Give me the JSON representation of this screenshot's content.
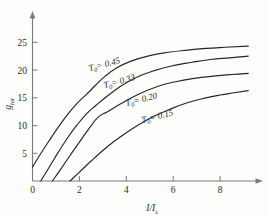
{
  "chart_data": {
    "type": "line",
    "title": "",
    "xlabel": "I/I_s",
    "ylabel": "g_tot",
    "xlim": [
      0,
      9.6
    ],
    "ylim": [
      0,
      26.5
    ],
    "grid": false,
    "legend_position": "inline-curve-labels",
    "xticks": [
      0,
      2,
      4,
      6,
      8
    ],
    "xtick_labels": [
      "0",
      "2",
      "4",
      "6",
      "8"
    ],
    "yticks": [
      5,
      10,
      15,
      20,
      25
    ],
    "ytick_labels": [
      "5",
      "10",
      "15",
      "20",
      "25"
    ],
    "series": [
      {
        "name": "T0 = 0.45",
        "label": "T",
        "label_sub": "0",
        "label_value": "= 0.45",
        "x": [
          0.0,
          0.3,
          0.7,
          1.1,
          1.5,
          1.9,
          2.3,
          2.7,
          3.1,
          3.6,
          4.2,
          5.0,
          5.8,
          6.6,
          7.4,
          8.2,
          9.2
        ],
        "y": [
          2.5,
          4.6,
          7.2,
          9.7,
          12.0,
          14.0,
          15.6,
          17.3,
          18.9,
          20.4,
          21.6,
          22.6,
          23.2,
          23.6,
          23.9,
          24.1,
          24.3
        ]
      },
      {
        "name": "T0 = 0.33",
        "label": "T",
        "label_sub": "0",
        "label_value": "= 0.33",
        "x": [
          0.35,
          0.7,
          1.1,
          1.5,
          1.9,
          2.3,
          2.7,
          3.1,
          3.7,
          4.4,
          5.2,
          6.0,
          6.8,
          7.6,
          8.4,
          9.2
        ],
        "y": [
          0.0,
          2.4,
          5.2,
          7.8,
          10.1,
          12.1,
          13.6,
          15.0,
          16.9,
          18.6,
          19.9,
          20.8,
          21.4,
          21.9,
          22.2,
          22.5
        ]
      },
      {
        "name": "T0 = 0.20",
        "label": "T",
        "label_sub": "0",
        "label_value": "= 0.20",
        "x": [
          0.85,
          1.2,
          1.6,
          2.0,
          2.4,
          2.8,
          3.2,
          3.8,
          4.5,
          5.3,
          6.1,
          6.9,
          7.7,
          8.5,
          9.2
        ],
        "y": [
          0.0,
          2.1,
          4.6,
          7.0,
          9.4,
          11.5,
          12.5,
          14.0,
          15.6,
          17.0,
          17.9,
          18.5,
          18.9,
          19.2,
          19.4
        ]
      },
      {
        "name": "T0 = 0.15",
        "label": "T",
        "label_sub": "0",
        "label_value": "= 0.15",
        "x": [
          1.6,
          2.0,
          2.5,
          3.0,
          3.5,
          4.0,
          4.6,
          5.2,
          5.9,
          6.6,
          7.3,
          8.0,
          8.6,
          9.2
        ],
        "y": [
          0.0,
          1.6,
          3.6,
          5.5,
          7.2,
          8.7,
          10.3,
          11.7,
          13.0,
          14.1,
          14.9,
          15.5,
          15.9,
          16.3
        ]
      }
    ]
  },
  "axis": {
    "y_title_main": "g",
    "y_title_sub": "tot",
    "x_title_num": "I",
    "x_title_slash": "/",
    "x_title_den": "I",
    "x_title_den_sub": "s"
  }
}
